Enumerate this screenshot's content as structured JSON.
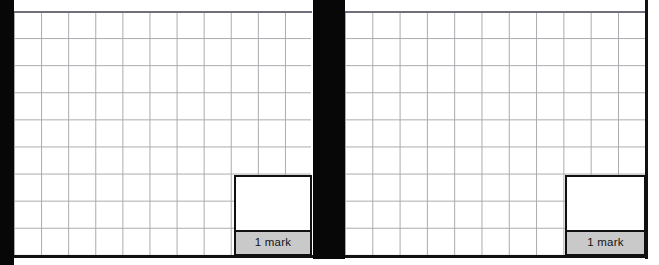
{
  "document": {
    "type": "exam-answer-sheet-scan",
    "page_background": "#ffffff",
    "scan_edge_color": "#070707"
  },
  "panels": [
    {
      "id": "left-question-panel",
      "grid": {
        "columns": 11,
        "rows": 9,
        "cell_size_px": 27,
        "line_color": "#a9a9ad",
        "border_color": "#111111"
      },
      "answer_box": {
        "mark_label": "1 mark",
        "label_background": "#c9c9c9",
        "label_text_color": "#141414",
        "box_background": "#ffffff",
        "box_border_color": "#111111"
      }
    },
    {
      "id": "right-question-panel",
      "grid": {
        "columns": 11,
        "rows": 9,
        "cell_size_px": 27,
        "line_color": "#a9a9ad",
        "border_color": "#111111"
      },
      "answer_box": {
        "mark_label": "1 mark",
        "label_background": "#c9c9c9",
        "label_text_color": "#141414",
        "box_background": "#ffffff",
        "box_border_color": "#111111"
      }
    }
  ]
}
